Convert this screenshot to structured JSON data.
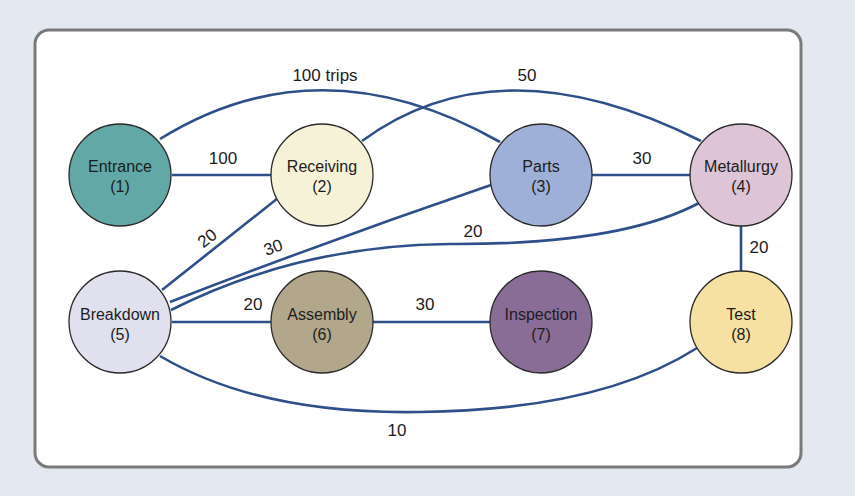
{
  "diagram": {
    "title": "",
    "background_color": "#e3e8f1",
    "panel_color": "#ffffff",
    "panel_border_color": "#7a7a7a",
    "edge_color": "#2d4f8a",
    "nodes": [
      {
        "id": 1,
        "name": "Entrance",
        "number": "(1)",
        "color": "#62a8a6"
      },
      {
        "id": 2,
        "name": "Receiving",
        "number": "(2)",
        "color": "#f6f2d8"
      },
      {
        "id": 3,
        "name": "Parts",
        "number": "(3)",
        "color": "#9fb0d8"
      },
      {
        "id": 4,
        "name": "Metallurgy",
        "number": "(4)",
        "color": "#ddc4d6"
      },
      {
        "id": 5,
        "name": "Breakdown",
        "number": "(5)",
        "color": "#e0e0ee"
      },
      {
        "id": 6,
        "name": "Assembly",
        "number": "(6)",
        "color": "#b2a78a"
      },
      {
        "id": 7,
        "name": "Inspection",
        "number": "(7)",
        "color": "#8a6d97"
      },
      {
        "id": 8,
        "name": "Test",
        "number": "(8)",
        "color": "#f6e1a2"
      }
    ],
    "edges": [
      {
        "from": 1,
        "to": 2,
        "label": "100"
      },
      {
        "from": 1,
        "to": 3,
        "label": "100 trips"
      },
      {
        "from": 2,
        "to": 4,
        "label": "50"
      },
      {
        "from": 3,
        "to": 4,
        "label": "30"
      },
      {
        "from": 5,
        "to": 2,
        "label": "20"
      },
      {
        "from": 5,
        "to": 3,
        "label": "30"
      },
      {
        "from": 5,
        "to": 4,
        "label": "20"
      },
      {
        "from": 4,
        "to": 8,
        "label": "20"
      },
      {
        "from": 5,
        "to": 6,
        "label": "20"
      },
      {
        "from": 6,
        "to": 7,
        "label": "30"
      },
      {
        "from": 5,
        "to": 8,
        "label": "10"
      }
    ]
  }
}
